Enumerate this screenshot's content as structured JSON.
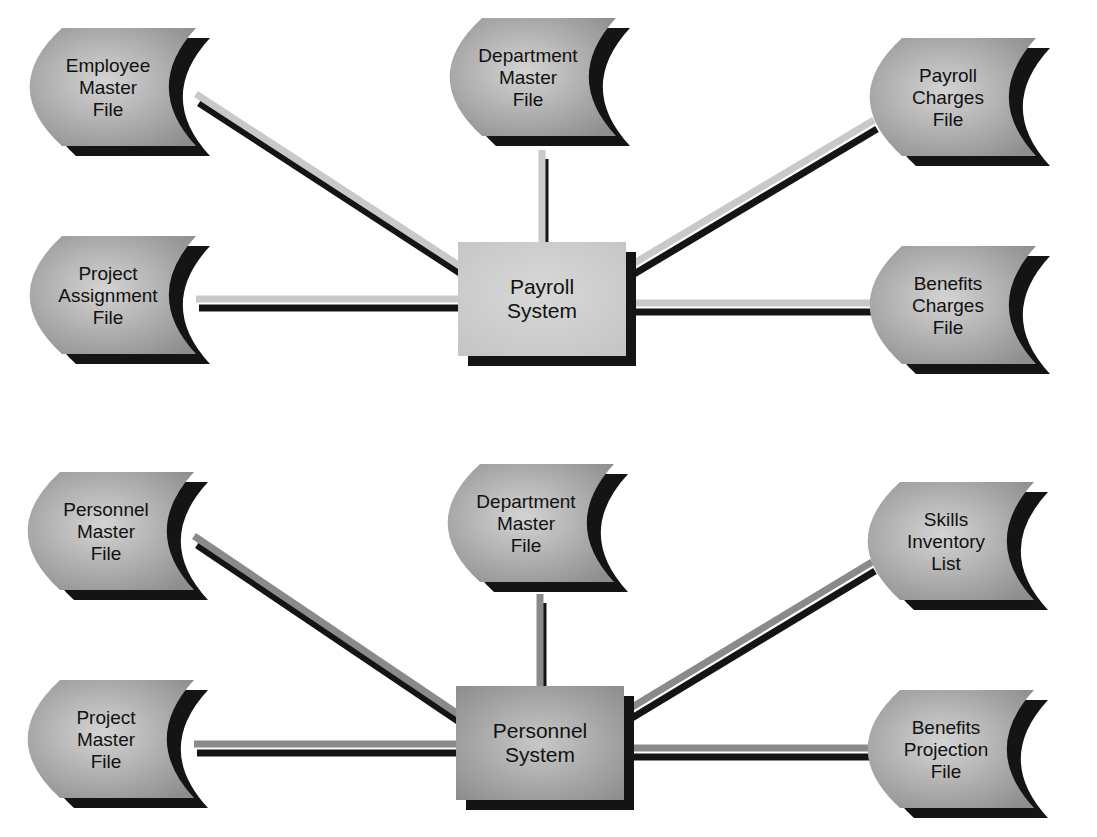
{
  "colors": {
    "background": "#ffffff",
    "shadow": "#141414",
    "node_fill_light": "#d2d2d2",
    "node_fill_dark": "#909090",
    "top_connector": "#c9c9c9",
    "bottom_connector": "#8a8a8a",
    "top_system_fill": "#cfcfcf",
    "bottom_system_fill": "#a3a3a3",
    "text": "#111111"
  },
  "diagrams": [
    {
      "name": "payroll",
      "connector_color": "#c9c9c9",
      "system": {
        "label_lines": [
          "Payroll",
          "System"
        ],
        "x": 458,
        "y": 242,
        "w": 168,
        "h": 114,
        "fill": "#cfcfcf"
      },
      "files": [
        {
          "id": "employee-master-file",
          "label_lines": [
            "Employee",
            "Master",
            "File"
          ],
          "x": 28,
          "y": 28,
          "anchor": [
            196,
            94
          ]
        },
        {
          "id": "department-master-file",
          "label_lines": [
            "Department",
            "Master",
            "File"
          ],
          "x": 448,
          "y": 18,
          "anchor": [
            542,
            150
          ]
        },
        {
          "id": "payroll-charges-file",
          "label_lines": [
            "Payroll",
            "Charges",
            "File"
          ],
          "x": 868,
          "y": 38,
          "anchor": [
            874,
            120
          ]
        },
        {
          "id": "project-assignment-file",
          "label_lines": [
            "Project",
            "Assignment",
            "File"
          ],
          "x": 28,
          "y": 236,
          "anchor": [
            196,
            300
          ]
        },
        {
          "id": "benefits-charges-file",
          "label_lines": [
            "Benefits",
            "Charges",
            "File"
          ],
          "x": 868,
          "y": 246,
          "anchor": [
            874,
            306
          ]
        }
      ],
      "edges": [
        {
          "from": [
            196,
            94
          ],
          "to": [
            460,
            266
          ]
        },
        {
          "from": [
            542,
            150
          ],
          "to": [
            542,
            244
          ]
        },
        {
          "from": [
            874,
            120
          ],
          "to": [
            626,
            268
          ]
        },
        {
          "from": [
            196,
            299
          ],
          "to": [
            460,
            299
          ]
        },
        {
          "from": [
            626,
            303
          ],
          "to": [
            874,
            303
          ]
        }
      ]
    },
    {
      "name": "personnel",
      "connector_color": "#8a8a8a",
      "system": {
        "label_lines": [
          "Personnel",
          "System"
        ],
        "x": 456,
        "y": 686,
        "w": 168,
        "h": 114,
        "fill": "#a3a3a3"
      },
      "files": [
        {
          "id": "personnel-master-file",
          "label_lines": [
            "Personnel",
            "Master",
            "File"
          ],
          "x": 26,
          "y": 472,
          "anchor": [
            194,
            536
          ]
        },
        {
          "id": "department-master-file-2",
          "label_lines": [
            "Department",
            "Master",
            "File"
          ],
          "x": 446,
          "y": 464,
          "anchor": [
            540,
            594
          ]
        },
        {
          "id": "skills-inventory-list",
          "label_lines": [
            "Skills",
            "Inventory",
            "List"
          ],
          "x": 866,
          "y": 482,
          "anchor": [
            872,
            562
          ]
        },
        {
          "id": "project-master-file",
          "label_lines": [
            "Project",
            "Master",
            "File"
          ],
          "x": 26,
          "y": 680,
          "anchor": [
            194,
            744
          ]
        },
        {
          "id": "benefits-projection-file",
          "label_lines": [
            "Benefits",
            "Projection",
            "File"
          ],
          "x": 866,
          "y": 690,
          "anchor": [
            872,
            750
          ]
        }
      ],
      "edges": [
        {
          "from": [
            194,
            536
          ],
          "to": [
            458,
            714
          ]
        },
        {
          "from": [
            540,
            594
          ],
          "to": [
            540,
            688
          ]
        },
        {
          "from": [
            872,
            562
          ],
          "to": [
            624,
            712
          ]
        },
        {
          "from": [
            194,
            744
          ],
          "to": [
            458,
            744
          ]
        },
        {
          "from": [
            624,
            748
          ],
          "to": [
            872,
            748
          ]
        }
      ]
    }
  ]
}
